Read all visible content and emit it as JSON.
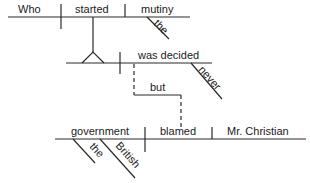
{
  "diagram": {
    "type": "Reed-Kellogg sentence diagram",
    "sentence_parts": {
      "noun_clause": {
        "subject": "Who",
        "verb": "started",
        "object": "mutiny",
        "object_modifier": "the"
      },
      "main_clause": {
        "verb": "was decided",
        "adverb": "never"
      },
      "conjunction": "but",
      "second_clause": {
        "subject": "government",
        "subject_modifiers": [
          "the",
          "British"
        ],
        "verb": "blamed",
        "object": "Mr. Christian"
      }
    },
    "colors": {
      "line": "#2a2a2a",
      "text": "#1a1a1a",
      "background": "#ffffff"
    }
  }
}
